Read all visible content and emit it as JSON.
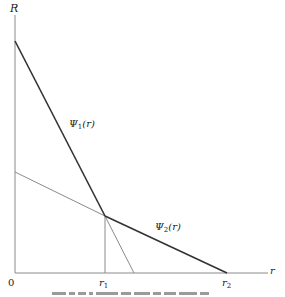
{
  "diagram": {
    "axes": {
      "y_label": "R",
      "x_label": "r",
      "origin_label": "0"
    },
    "x_ticks": [
      {
        "id": "r1",
        "base": "r",
        "sub": "1"
      },
      {
        "id": "r2",
        "base": "r",
        "sub": "2"
      }
    ],
    "curves": [
      {
        "id": "psi1",
        "base": "Ψ",
        "sub": "1",
        "arg": "(r)",
        "style": "thick"
      },
      {
        "id": "psi2",
        "base": "Ψ",
        "sub": "2",
        "arg": "(r)",
        "style": "thick"
      }
    ],
    "colors": {
      "thick_line": "#333333",
      "thin_line": "#8a8a8a",
      "axis": "#8a8a8a"
    }
  },
  "caption": {
    "visible": "partially cropped, unreadable"
  }
}
